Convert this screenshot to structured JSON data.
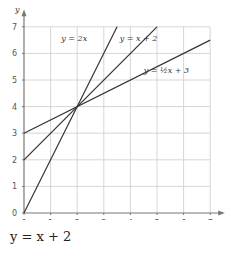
{
  "chart_data": {
    "type": "line",
    "title": "",
    "xlabel": "x",
    "ylabel": "y",
    "xlim": [
      0,
      7
    ],
    "ylim": [
      0,
      7
    ],
    "grid": true,
    "x_ticks": [
      "0",
      "1",
      "2",
      "3",
      "4",
      "5",
      "6",
      "7"
    ],
    "y_ticks": [
      "0",
      "1",
      "2",
      "3",
      "4",
      "5",
      "6",
      "7"
    ],
    "series": [
      {
        "name": "y = 2x",
        "x": [
          0,
          3.5
        ],
        "y": [
          0,
          7
        ]
      },
      {
        "name": "y = x + 2",
        "x": [
          0,
          5
        ],
        "y": [
          2,
          7
        ]
      },
      {
        "name": "y = ½x + 3",
        "x": [
          0,
          7
        ],
        "y": [
          3,
          6.5
        ]
      }
    ],
    "annotations": [
      {
        "text": "y = 2x",
        "near": [
          2.7,
          6.8
        ]
      },
      {
        "text": "y = x + 2",
        "near": [
          4.7,
          6.6
        ]
      },
      {
        "text": "y = ½x + 3",
        "near": [
          5.5,
          4.7
        ]
      }
    ],
    "intersection": [
      2,
      4
    ]
  },
  "caption": "y = x + 2"
}
